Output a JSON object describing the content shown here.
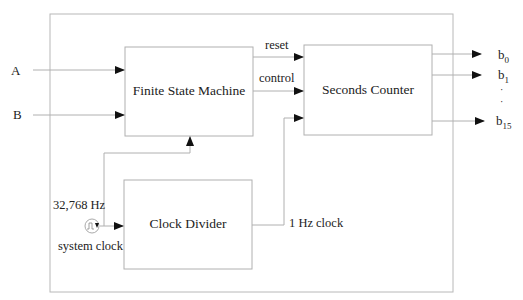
{
  "diagram": {
    "title": "",
    "blocks": {
      "fsm": {
        "label": "Finite State Machine"
      },
      "counter": {
        "label": "Seconds Counter"
      },
      "divider": {
        "label": "Clock Divider"
      }
    },
    "inputs": {
      "a": "A",
      "b": "B"
    },
    "signals": {
      "reset": "reset",
      "control": "control",
      "one_hz": "1 Hz clock",
      "freq": "32,768 Hz",
      "system_clock": "system clock"
    },
    "outputs": {
      "b0": {
        "base": "b",
        "sub": "0"
      },
      "b1": {
        "base": "b",
        "sub": "1"
      },
      "ellipsis": "·",
      "b15": {
        "base": "b",
        "sub": "15"
      }
    },
    "colors": {
      "line": "#b0b0b0",
      "arrow": "#111111",
      "text": "#222222"
    }
  }
}
